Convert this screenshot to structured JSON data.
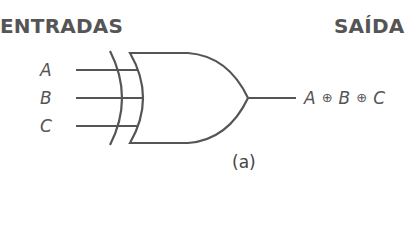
{
  "headings": {
    "inputs": "ENTRADAS",
    "output": "SAÍDA"
  },
  "inputs": [
    {
      "label": "A"
    },
    {
      "label": "B"
    },
    {
      "label": "C"
    }
  ],
  "gate": {
    "type": "XOR",
    "num_inputs": 3
  },
  "output": {
    "terms": [
      "A",
      "B",
      "C"
    ],
    "operator": "⊕"
  },
  "caption": "(a)",
  "colors": {
    "stroke": "#555555",
    "text": "#555555"
  }
}
